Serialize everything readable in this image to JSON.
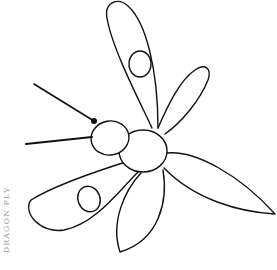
{
  "illustration": {
    "subject": "dragonfly line drawing",
    "stroke_color": "#111111",
    "background": "#ffffff"
  },
  "caption": {
    "text": "DRAGON FLY"
  }
}
